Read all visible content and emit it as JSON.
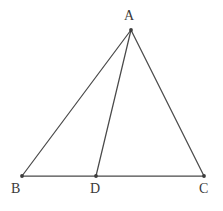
{
  "figure": {
    "kind": "geometry-diagram",
    "background_color": "#ffffff",
    "stroke_color": "#4a4a4a",
    "label_color": "#3a3a3a",
    "vertex_marker_color": "#3c3c3c",
    "canvas": {
      "width": 223,
      "height": 211
    }
  },
  "points": [
    {
      "id": "A",
      "label": "A",
      "x": 131,
      "y": 30,
      "label_x": 124,
      "label_y": 9
    },
    {
      "id": "B",
      "label": "B",
      "x": 22,
      "y": 176,
      "label_x": 11,
      "label_y": 182
    },
    {
      "id": "D",
      "label": "D",
      "x": 96,
      "y": 176,
      "label_x": 90,
      "label_y": 182
    },
    {
      "id": "C",
      "label": "C",
      "x": 204,
      "y": 176,
      "label_x": 199,
      "label_y": 182
    }
  ],
  "segments": [
    {
      "id": "AB",
      "from": "A",
      "to": "B",
      "x1": 131,
      "y1": 30,
      "x2": 22,
      "y2": 176,
      "role": "side"
    },
    {
      "id": "AC",
      "from": "A",
      "to": "C",
      "x1": 131,
      "y1": 30,
      "x2": 204,
      "y2": 176,
      "role": "side"
    },
    {
      "id": "BC",
      "from": "B",
      "to": "C",
      "x1": 22,
      "y1": 176,
      "x2": 204,
      "y2": 176,
      "role": "base"
    },
    {
      "id": "AD",
      "from": "A",
      "to": "D",
      "x1": 131,
      "y1": 30,
      "x2": 96,
      "y2": 176,
      "role": "cevian"
    }
  ]
}
